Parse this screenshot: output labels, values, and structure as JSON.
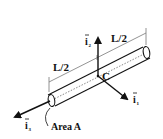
{
  "diagram": {
    "title": "",
    "labels": {
      "segment_left": "L/2",
      "segment_right": "L/2",
      "center": "C",
      "area": "Area A"
    },
    "axes": [
      {
        "name": "i",
        "subscript": "1",
        "direction": "down-right"
      },
      {
        "name": "i",
        "subscript": "2",
        "direction": "up"
      },
      {
        "name": "i",
        "subscript": "3",
        "direction": "down-left"
      }
    ],
    "colors": {
      "stroke": "#111111",
      "dimension_line": "#777777",
      "background": "#ffffff"
    }
  }
}
